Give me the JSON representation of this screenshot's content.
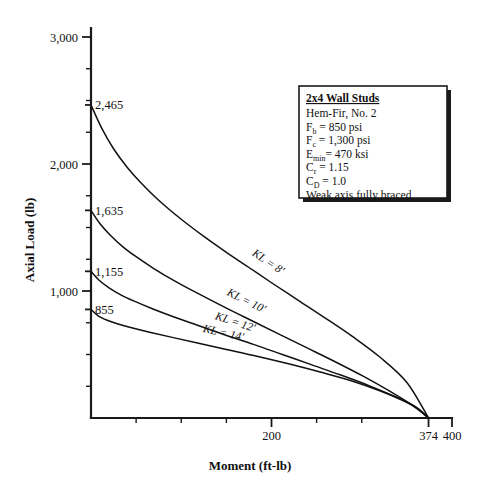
{
  "chart_data": {
    "type": "line",
    "title": "",
    "xlabel": "Moment (ft-lb)",
    "ylabel": "Axial Load (lb)",
    "xlim": [
      0,
      400
    ],
    "ylim": [
      0,
      3100
    ],
    "grid": false,
    "legend_position": "inside-curve-labels",
    "x_ticks": [
      0,
      50,
      100,
      150,
      200,
      250,
      300,
      374,
      400
    ],
    "x_tick_labels": [
      "",
      "",
      "",
      "",
      "200",
      "",
      "",
      "374",
      "400"
    ],
    "y_ticks": [
      0,
      250,
      500,
      750,
      1000,
      1250,
      1500,
      1750,
      2000,
      2250,
      2500,
      2750,
      3000
    ],
    "y_tick_labels": [
      "",
      "",
      "",
      "",
      "1,000",
      "",
      "",
      "",
      "2,000",
      "",
      "",
      "",
      "3,000"
    ],
    "convergence_point": {
      "x": 374,
      "y": 0,
      "label": "374"
    },
    "series": [
      {
        "name": "KL = 8'",
        "label": "KL = 8'",
        "start_load": 2465,
        "start_label": "2,465",
        "points": [
          [
            0,
            2465
          ],
          [
            12,
            2280
          ],
          [
            25,
            2120
          ],
          [
            40,
            1975
          ],
          [
            55,
            1855
          ],
          [
            75,
            1715
          ],
          [
            100,
            1565
          ],
          [
            125,
            1430
          ],
          [
            150,
            1305
          ],
          [
            175,
            1185
          ],
          [
            200,
            1065
          ],
          [
            230,
            925
          ],
          [
            260,
            785
          ],
          [
            290,
            640
          ],
          [
            320,
            480
          ],
          [
            350,
            280
          ],
          [
            374,
            0
          ]
        ]
      },
      {
        "name": "KL = 10'",
        "label": "KL = 10'",
        "start_load": 1635,
        "start_label": "1,635",
        "points": [
          [
            0,
            1635
          ],
          [
            10,
            1530
          ],
          [
            22,
            1435
          ],
          [
            35,
            1350
          ],
          [
            50,
            1270
          ],
          [
            70,
            1175
          ],
          [
            95,
            1070
          ],
          [
            120,
            975
          ],
          [
            150,
            865
          ],
          [
            180,
            760
          ],
          [
            210,
            655
          ],
          [
            240,
            550
          ],
          [
            270,
            445
          ],
          [
            300,
            335
          ],
          [
            330,
            215
          ],
          [
            355,
            105
          ],
          [
            374,
            0
          ]
        ]
      },
      {
        "name": "KL = 12'",
        "label": "KL = 12'",
        "start_load": 1155,
        "start_label": "1,155",
        "points": [
          [
            0,
            1155
          ],
          [
            9,
            1085
          ],
          [
            20,
            1025
          ],
          [
            33,
            970
          ],
          [
            48,
            920
          ],
          [
            68,
            860
          ],
          [
            92,
            795
          ],
          [
            118,
            730
          ],
          [
            148,
            655
          ],
          [
            180,
            580
          ],
          [
            212,
            500
          ],
          [
            244,
            420
          ],
          [
            276,
            340
          ],
          [
            308,
            255
          ],
          [
            338,
            165
          ],
          [
            358,
            95
          ],
          [
            374,
            0
          ]
        ]
      },
      {
        "name": "KL = 14'",
        "label": "KL = 14'",
        "start_load": 855,
        "start_label": "855",
        "points": [
          [
            0,
            855
          ],
          [
            8,
            805
          ],
          [
            18,
            770
          ],
          [
            30,
            740
          ],
          [
            45,
            710
          ],
          [
            65,
            675
          ],
          [
            90,
            635
          ],
          [
            118,
            590
          ],
          [
            150,
            540
          ],
          [
            185,
            485
          ],
          [
            220,
            425
          ],
          [
            255,
            360
          ],
          [
            290,
            290
          ],
          [
            320,
            215
          ],
          [
            345,
            140
          ],
          [
            362,
            75
          ],
          [
            374,
            0
          ]
        ]
      }
    ]
  },
  "legend": {
    "title": "2x4 Wall Studs",
    "lines": [
      {
        "id": "species",
        "text": "Hem-Fir, No. 2",
        "base": "Hem-Fir, No. 2",
        "sub": "",
        "rest": ""
      },
      {
        "id": "fb",
        "text": "Fb = 850 psi",
        "base": "F",
        "sub": "b",
        "rest": " = 850 psi"
      },
      {
        "id": "fc",
        "text": "Fc = 1,300 psi",
        "base": "F",
        "sub": "c",
        "rest": " = 1,300 psi"
      },
      {
        "id": "emin",
        "text": "Emin = 470 ksi",
        "base": "E",
        "sub": "min",
        "rest": "= 470 ksi"
      },
      {
        "id": "cr",
        "text": "Cr = 1.15",
        "base": "C",
        "sub": "r",
        "rest": " = 1.15"
      },
      {
        "id": "cd",
        "text": "CD = 1.0",
        "base": "C",
        "sub": "D",
        "rest": " = 1.0"
      },
      {
        "id": "bracing",
        "text": "Weak axis fully braced",
        "base": "Weak axis fully braced",
        "sub": "",
        "rest": ""
      }
    ]
  },
  "colors": {
    "curve": "#111111",
    "axis": "#1a1a1a",
    "background": "#ffffff",
    "text": "#111111"
  }
}
